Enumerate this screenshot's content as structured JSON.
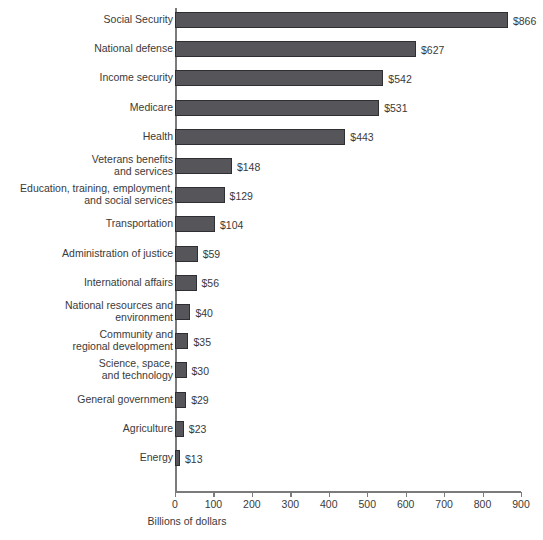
{
  "chart_data": {
    "type": "bar",
    "orientation": "horizontal",
    "title": "",
    "xlabel": "Billions of dollars",
    "ylabel": "",
    "xlim": [
      0,
      900
    ],
    "xticks": [
      0,
      100,
      200,
      300,
      400,
      500,
      600,
      700,
      800,
      900
    ],
    "xtick_labels": [
      "0",
      "100",
      "200",
      "300",
      "400",
      "500",
      "600",
      "700",
      "800",
      "900"
    ],
    "grid": false,
    "legend": null,
    "bar_color": "#55555a",
    "bar_edge_color": "#2e2e33",
    "axis_color": "#7b7b7b",
    "text_color": "#3a3a3a",
    "background_color": "#ffffff",
    "categories": [
      "Social Security",
      "National defense",
      "Income security",
      "Medicare",
      "Health",
      "Veterans benefits\nand services",
      "Education, training, employment,\nand social services",
      "Transportation",
      "Administration of justice",
      "International affairs",
      "National resources and\nenvironment",
      "Community and\nregional development",
      "Science, space,\nand technology",
      "General government",
      "Agriculture",
      "Energy"
    ],
    "values": [
      866,
      627,
      542,
      531,
      443,
      148,
      129,
      104,
      59,
      56,
      40,
      35,
      30,
      29,
      23,
      13
    ],
    "value_labels": [
      "$866",
      "$627",
      "$542",
      "$531",
      "$443",
      "$148",
      "$129",
      "$104",
      "$59",
      "$56",
      "$40",
      "$35",
      "$30",
      "$29",
      "$23",
      "$13"
    ]
  }
}
